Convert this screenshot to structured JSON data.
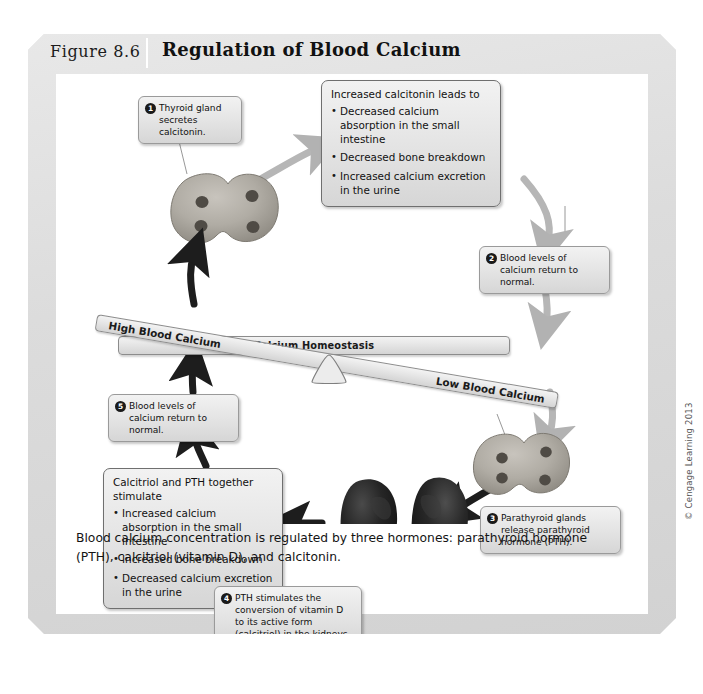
{
  "figure": {
    "number": "Figure 8.6",
    "title": "Regulation of Blood Calcium",
    "caption": "Blood calcium concentration is regulated by three hormones: parathyroid hormone (PTH), calcitriol (vitamin D), and calcitonin.",
    "credit": "© Cengage Learning 2013"
  },
  "balance": {
    "center_label": "Calcium Homeostasis",
    "left_label": "High Blood Calcium",
    "right_label": "Low Blood Calcium"
  },
  "steps": {
    "step1": {
      "number": "1",
      "text": "Thyroid gland secretes calcitonin."
    },
    "step2": {
      "number": "2",
      "text": "Blood levels of calcium return to normal."
    },
    "step3": {
      "number": "3",
      "text": "Parathyroid glands release parathyroid hormone (PTH)."
    },
    "step4": {
      "number": "4",
      "text": "PTH stimulates the conversion of vitamin D to its active form (calcitriol) in the kidneys."
    },
    "step5": {
      "number": "5",
      "text": "Blood levels of calcium return to normal."
    }
  },
  "calcitonin_effects": {
    "heading": "Increased calcitonin leads to",
    "items": [
      "Decreased calcium absorption in the small intestine",
      "Decreased bone breakdown",
      "Increased calcium excretion in the urine"
    ]
  },
  "calcitriol_pth_effects": {
    "heading": "Calcitriol and PTH together stimulate",
    "items": [
      "Increased calcium absorption in the small intestine",
      "Increased bone breakdown",
      "Decreased calcium excretion in the urine"
    ]
  },
  "anatomy": {
    "thyroid_top": "thyroid-gland-illustration",
    "thyroid_bottom": "parathyroid-gland-illustration",
    "kidneys": "kidneys-illustration"
  },
  "colors": {
    "frame": "#dedede",
    "panel": "#ffffff",
    "callout_fill": "#e6e6e6",
    "callout_border": "#8f8f8f",
    "arrow_gray": "#b4b4b4",
    "arrow_dark": "#1d1d1d",
    "text": "#111111"
  }
}
